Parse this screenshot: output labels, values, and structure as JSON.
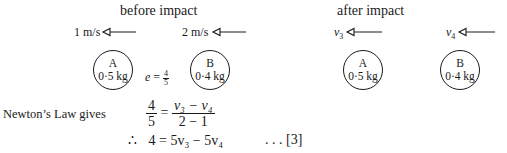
{
  "before": {
    "title": "before impact",
    "ball_a": {
      "name": "A",
      "mass": "0·5 kg",
      "velocity": "1 m/s"
    },
    "ball_b": {
      "name": "B",
      "mass": "0·4 kg",
      "velocity": "2 m/s"
    },
    "restitution": {
      "symbol": "e",
      "eq": "=",
      "num": "4",
      "den": "5"
    }
  },
  "after": {
    "title": "after impact",
    "ball_a": {
      "name": "A",
      "mass": "0·5 kg",
      "velocity_sym": "v",
      "velocity_sub": "3"
    },
    "ball_b": {
      "name": "B",
      "mass": "0·4 kg",
      "velocity_sym": "v",
      "velocity_sub": "4"
    }
  },
  "working": {
    "label": "Newton’s Law gives",
    "line1": {
      "lhs_num": "4",
      "lhs_den": "5",
      "eq": "=",
      "rhs_num": "v₃ − v₄",
      "rhs_den": "2 − 1"
    },
    "line2": {
      "therefore": "∴",
      "text": "4 = 5v₃ − 5v₄",
      "ref": ". . . [3]"
    }
  },
  "colors": {
    "ink": "#1a1a1a",
    "background": "#ffffff"
  }
}
